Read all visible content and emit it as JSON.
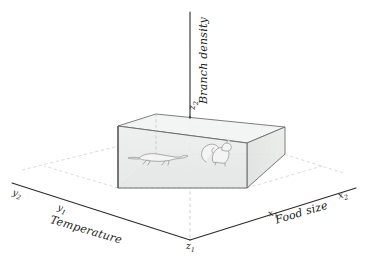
{
  "figure": {
    "type": "3d-niche-diagram",
    "background_color": "#ffffff",
    "axes": {
      "vertical": {
        "name": "Branch density",
        "tick_label": "z2",
        "tick_display": "z",
        "tick_sub": "2",
        "origin_label": "z1",
        "origin_display": "z",
        "origin_sub": "1"
      },
      "left": {
        "name": "Temperature",
        "near_tick": "y1",
        "near_display": "y",
        "near_sub": "1",
        "far_tick": "y2",
        "far_display": "y",
        "far_sub": "2"
      },
      "right": {
        "name": "Food size",
        "near_tick": "x1",
        "near_display": "x",
        "near_sub": "1",
        "far_tick": "x2",
        "far_display": "x",
        "far_sub": "2"
      }
    },
    "volume": {
      "description": "shaded rectangular niche volume",
      "fill_color": "#e9ecea",
      "edge_color": "#6b6b6b"
    },
    "organisms": [
      {
        "name": "salamander-illustration"
      },
      {
        "name": "squirrel-illustration"
      }
    ],
    "colors": {
      "axis_line": "#2b2b2b",
      "grid_dashed": "#c9c9c9",
      "label_text": "#1a1a1a",
      "box_fill": "#e9ecea",
      "box_edge": "#6b6b6b",
      "animal_stroke": "#9a9a9a"
    }
  }
}
